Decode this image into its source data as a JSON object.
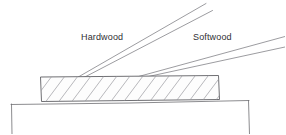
{
  "figure": {
    "background_color": "#ffffff",
    "line_color": "#6e6e72",
    "hatch_color": "#9a9a9f",
    "text_color": "#2f2f33",
    "labels": [
      {
        "id": "hardwood",
        "text": "Hardwood",
        "x": 81,
        "y": 33
      },
      {
        "id": "softwood",
        "text": "Softwood",
        "x": 193,
        "y": 33
      }
    ],
    "board": {
      "name": "hatched-board",
      "left": 40,
      "right": 219,
      "top": 76,
      "bottom": 101,
      "hatch_angle_degrees": 52,
      "hatch_spacing": 13
    },
    "table": {
      "name": "table-surface",
      "top_y": 103,
      "left_x": 11,
      "right_x": 249,
      "leg_bottom_y": 134
    },
    "leaders": [
      {
        "id": "hardwood-leader",
        "from_x": 76,
        "from_y": 77,
        "to_x": 205,
        "to_y": 4
      },
      {
        "id": "softwood-leader",
        "from_x": 135,
        "from_y": 77,
        "to_x": 285,
        "to_y": 37
      }
    ]
  }
}
